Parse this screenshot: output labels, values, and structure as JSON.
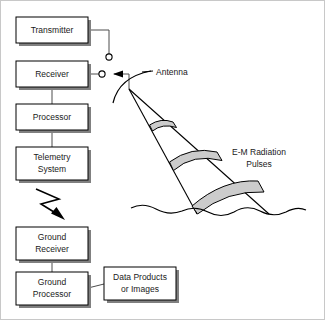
{
  "diagram": {
    "background_color": "#ffffff",
    "line_color": "#000000",
    "band_fill_color": "#cccccc",
    "box_fill_color": "#ffffff",
    "shadow_color": "#808080",
    "boxes": [
      {
        "id": "transmitter",
        "label": "Transmitter",
        "lines": [
          "Transmitter"
        ],
        "x": 15,
        "y": 16,
        "w": 72,
        "h": 26
      },
      {
        "id": "receiver",
        "label": "Receiver",
        "lines": [
          "Receiver"
        ],
        "x": 15,
        "y": 60,
        "w": 72,
        "h": 26
      },
      {
        "id": "processor",
        "label": "Processor",
        "lines": [
          "Processor"
        ],
        "x": 15,
        "y": 103,
        "w": 72,
        "h": 26
      },
      {
        "id": "telemetry-system",
        "label": "Telemetry System",
        "lines": [
          "Telemetry",
          "System"
        ],
        "x": 15,
        "y": 146,
        "w": 72,
        "h": 33
      },
      {
        "id": "ground-receiver",
        "label": "Ground Receiver",
        "lines": [
          "Ground",
          "Receiver"
        ],
        "x": 15,
        "y": 226,
        "w": 72,
        "h": 33
      },
      {
        "id": "ground-processor",
        "label": "Ground Processor",
        "lines": [
          "Ground",
          "Processor"
        ],
        "x": 15,
        "y": 271,
        "w": 72,
        "h": 33
      },
      {
        "id": "data-products",
        "label": "Data Products or Images",
        "lines": [
          "Data Products",
          "or Images"
        ],
        "x": 103,
        "y": 266,
        "w": 72,
        "h": 33
      }
    ],
    "annotations": [
      {
        "id": "antenna",
        "lines": [
          "Antenna"
        ],
        "x": 155,
        "y": 72
      },
      {
        "id": "em-pulses",
        "lines": [
          "E-M Radiation",
          "Pulses"
        ],
        "x": 258,
        "y": 157
      }
    ],
    "connections": [
      {
        "id": "transmitter-to-switch",
        "from": "transmitter",
        "to": "tr-switch"
      },
      {
        "id": "receiver-to-antenna",
        "from": "receiver",
        "to": "antenna"
      },
      {
        "id": "receiver-to-processor",
        "from": "receiver",
        "to": "processor"
      },
      {
        "id": "processor-to-telemetry",
        "from": "processor",
        "to": "telemetry-system"
      },
      {
        "id": "telemetry-downlink",
        "from": "telemetry-system",
        "to": "ground-receiver",
        "style": "lightning-bolt"
      },
      {
        "id": "groundrx-to-groundproc",
        "from": "ground-receiver",
        "to": "ground-processor"
      },
      {
        "id": "groundproc-to-data",
        "from": "ground-processor",
        "to": "data-products"
      }
    ],
    "pulse_bands": [
      {
        "id": "pulse-band-near",
        "order": 1
      },
      {
        "id": "pulse-band-mid",
        "order": 2
      },
      {
        "id": "pulse-band-far",
        "order": 3
      }
    ],
    "ground_surface": {
      "id": "ground-wave",
      "label": "wavy surface line"
    }
  }
}
